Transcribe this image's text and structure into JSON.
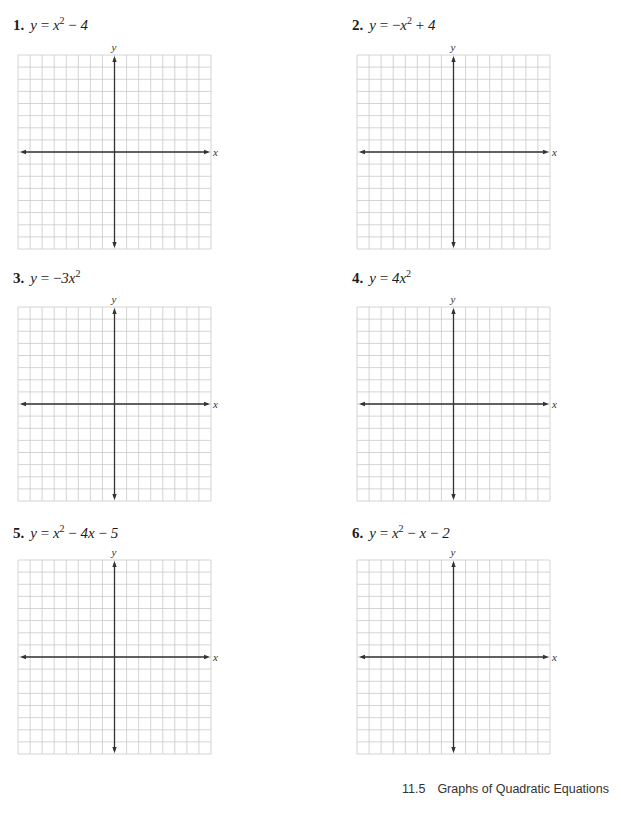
{
  "problems": [
    {
      "number": "1.",
      "lhs": "y",
      "eq": "=",
      "parts": [
        {
          "t": "x"
        },
        {
          "sup": "2"
        },
        {
          "op": " − "
        },
        {
          "t": "4"
        }
      ],
      "equation_text": "y = x^2 − 4"
    },
    {
      "number": "2.",
      "lhs": "y",
      "eq": "=",
      "parts": [
        {
          "op": "−"
        },
        {
          "t": "x"
        },
        {
          "sup": "2"
        },
        {
          "op": " + "
        },
        {
          "t": "4"
        }
      ],
      "equation_text": "y = −x^2 + 4"
    },
    {
      "number": "3.",
      "lhs": "y",
      "eq": "=",
      "parts": [
        {
          "op": "−"
        },
        {
          "t": "3x"
        },
        {
          "sup": "2"
        }
      ],
      "equation_text": "y = −3x^2"
    },
    {
      "number": "4.",
      "lhs": "y",
      "eq": "=",
      "parts": [
        {
          "t": "4x"
        },
        {
          "sup": "2"
        }
      ],
      "equation_text": "y = 4x^2"
    },
    {
      "number": "5.",
      "lhs": "y",
      "eq": "=",
      "parts": [
        {
          "t": "x"
        },
        {
          "sup": "2"
        },
        {
          "op": " − "
        },
        {
          "t": "4x"
        },
        {
          "op": " − "
        },
        {
          "t": "5"
        }
      ],
      "equation_text": "y = x^2 − 4x − 5"
    },
    {
      "number": "6.",
      "lhs": "y",
      "eq": "=",
      "parts": [
        {
          "t": "x"
        },
        {
          "sup": "2"
        },
        {
          "op": " − "
        },
        {
          "t": "x"
        },
        {
          "op": " − "
        },
        {
          "t": "2"
        }
      ],
      "equation_text": "y = x^2 − x − 2"
    }
  ],
  "graph": {
    "x_axis_label": "x",
    "y_axis_label": "y",
    "cells": 16,
    "grid_color": "#c9c9c9",
    "axis_color": "#333333"
  },
  "footer": {
    "section": "11.5",
    "title": "Graphs of Quadratic Equations"
  }
}
